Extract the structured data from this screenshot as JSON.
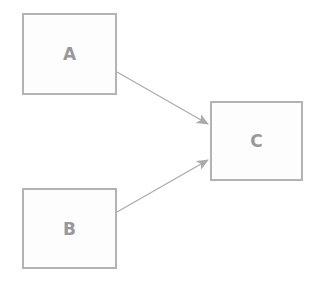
{
  "diagram": {
    "nodes": [
      {
        "id": "A",
        "label": "A"
      },
      {
        "id": "B",
        "label": "B"
      },
      {
        "id": "C",
        "label": "C"
      }
    ],
    "edges": [
      {
        "from": "A",
        "to": "C"
      },
      {
        "from": "B",
        "to": "C"
      }
    ],
    "colors": {
      "border": "#b3b3b3",
      "edge": "#aaaaaa",
      "label": "#999999"
    }
  }
}
